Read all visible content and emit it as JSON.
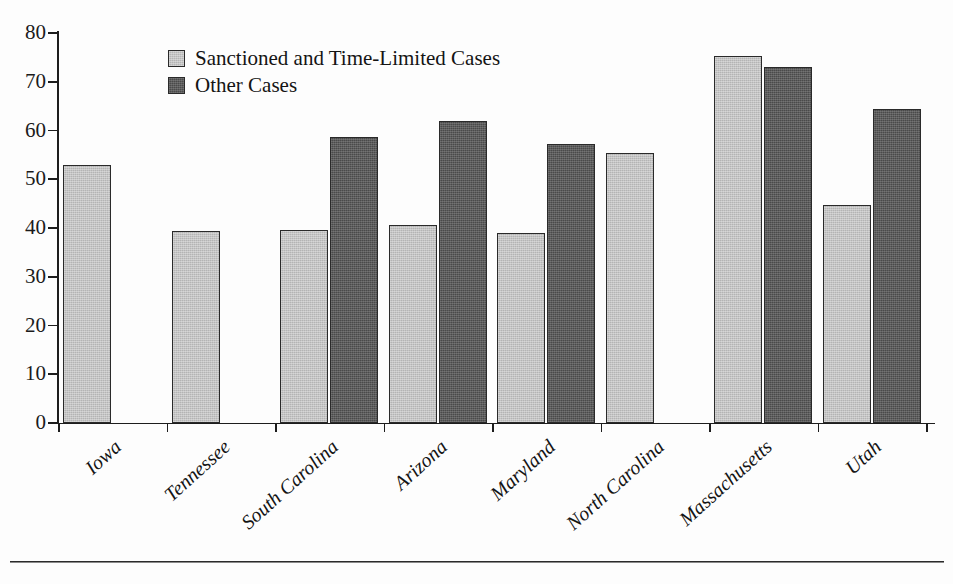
{
  "chart_data": {
    "type": "bar",
    "title": "",
    "subtitle": "",
    "xlabel": "",
    "ylabel": "",
    "ylim": [
      0,
      80
    ],
    "yticks": [
      0,
      10,
      20,
      30,
      40,
      50,
      60,
      70,
      80
    ],
    "ytick_labels": [
      "0",
      "10",
      "20",
      "30",
      "40",
      "50",
      "60",
      "70",
      "80"
    ],
    "grid": false,
    "legend_position": "top-left-inside",
    "categories": [
      "Iowa",
      "Tennessee",
      "South Carolina",
      "Arizona",
      "Maryland",
      "North Carolina",
      "Massachusetts",
      "Utah"
    ],
    "series": [
      {
        "name": "Sanctioned and Time-Limited Cases",
        "color": "#b4b4b4",
        "values": [
          53.0,
          39.3,
          39.5,
          40.7,
          39.0,
          55.4,
          75.2,
          44.8
        ]
      },
      {
        "name": "Other Cases",
        "color": "#4a4a4a",
        "values": [
          null,
          null,
          58.6,
          62.0,
          57.2,
          null,
          73.0,
          64.4
        ]
      }
    ],
    "annotations": []
  },
  "legend": {
    "items": [
      {
        "label": "Sanctioned and Time-Limited Cases",
        "swatch": "light"
      },
      {
        "label": "Other Cases",
        "swatch": "dark"
      }
    ]
  },
  "colors": {
    "series_light": "#b4b4b4",
    "series_dark": "#4a4a4a",
    "axis": "#1d1d1d",
    "background": "#fdfdfd",
    "text": "#141414"
  }
}
